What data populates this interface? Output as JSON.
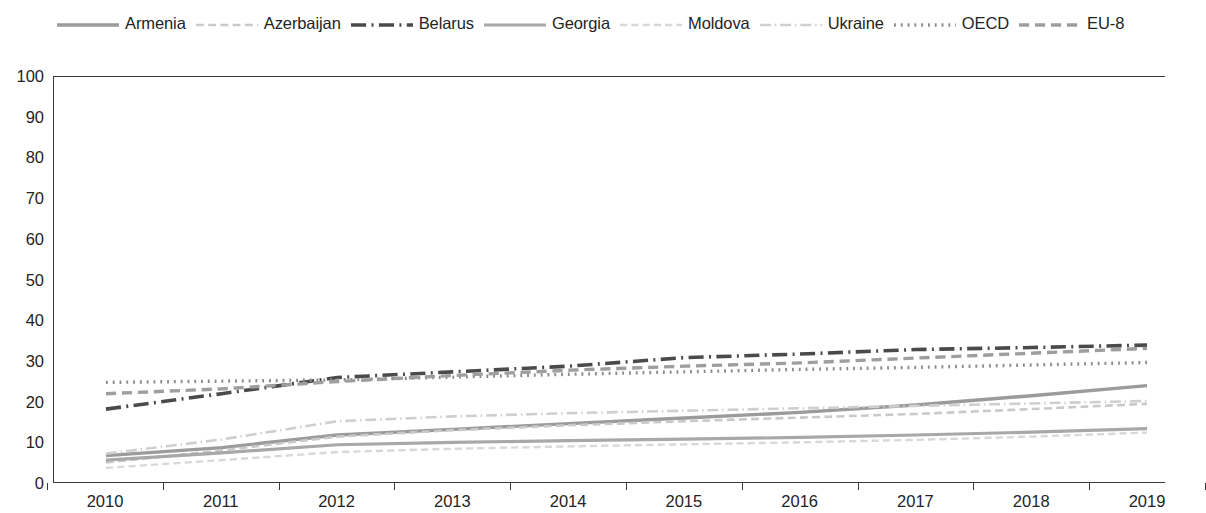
{
  "chart_data": {
    "type": "line",
    "title": "",
    "subtitle": "",
    "xlabel": "",
    "ylabel": "",
    "xlim": [
      2010,
      2019
    ],
    "ylim": [
      0,
      100
    ],
    "grid": false,
    "legend_position": "top",
    "x": [
      2010,
      2011,
      2012,
      2013,
      2014,
      2015,
      2016,
      2017,
      2018,
      2019
    ],
    "xticks": [
      "2010",
      "2011",
      "2012",
      "2013",
      "2014",
      "2015",
      "2016",
      "2017",
      "2018",
      "2019"
    ],
    "yticks": [
      "0",
      "10",
      "20",
      "30",
      "40",
      "50",
      "60",
      "70",
      "80",
      "90",
      "100"
    ],
    "series": [
      {
        "name": "Armenia",
        "style": "solid",
        "color": "#9b9b9b",
        "width": 3.4,
        "values": [
          6.5,
          8.5,
          11.6,
          13.0,
          14.4,
          15.8,
          17.2,
          19.0,
          21.3,
          23.8
        ]
      },
      {
        "name": "Azerbaijan",
        "style": "dashed",
        "color": "#c9c9c9",
        "width": 2.6,
        "values": [
          4.8,
          7.8,
          11.2,
          12.8,
          14.0,
          15.0,
          15.9,
          16.8,
          18.0,
          19.3
        ]
      },
      {
        "name": "Belarus",
        "style": "dashdot",
        "color": "#4a4a4a",
        "width": 3.6,
        "values": [
          18.0,
          21.8,
          25.8,
          27.2,
          28.6,
          30.7,
          31.6,
          32.7,
          33.2,
          33.8
        ]
      },
      {
        "name": "Georgia",
        "style": "solid",
        "color": "#a8a8a8",
        "width": 3.2,
        "values": [
          5.4,
          7.2,
          9.2,
          9.8,
          10.2,
          10.6,
          11.0,
          11.6,
          12.3,
          13.2
        ]
      },
      {
        "name": "Moldova",
        "style": "dashed",
        "color": "#d8d8d8",
        "width": 2.4,
        "values": [
          3.5,
          5.4,
          7.4,
          8.2,
          8.8,
          9.3,
          9.8,
          10.4,
          11.2,
          12.2
        ]
      },
      {
        "name": "Ukraine",
        "style": "dashdot",
        "color": "#cfcfcf",
        "width": 2.6,
        "values": [
          7.0,
          10.5,
          15.0,
          16.2,
          17.0,
          17.6,
          18.2,
          18.8,
          19.4,
          20.0
        ]
      },
      {
        "name": "OECD",
        "style": "dotted",
        "color": "#8c8c8c",
        "width": 3.4,
        "values": [
          24.6,
          24.9,
          25.2,
          25.9,
          26.6,
          27.2,
          27.8,
          28.3,
          28.9,
          29.5
        ]
      },
      {
        "name": "EU-8",
        "style": "dashed",
        "color": "#9e9e9e",
        "width": 3.4,
        "values": [
          21.8,
          23.0,
          24.8,
          26.3,
          27.6,
          28.6,
          29.4,
          30.6,
          31.8,
          33.0
        ]
      }
    ]
  },
  "legend": {
    "items": [
      {
        "label": "Armenia"
      },
      {
        "label": "Azerbaijan"
      },
      {
        "label": "Belarus"
      },
      {
        "label": "Georgia"
      },
      {
        "label": "Moldova"
      },
      {
        "label": "Ukraine"
      },
      {
        "label": "OECD"
      },
      {
        "label": "EU-8"
      }
    ]
  },
  "colors": {
    "axis": "#3a3a3a",
    "text": "#242424",
    "background": "#ffffff"
  }
}
